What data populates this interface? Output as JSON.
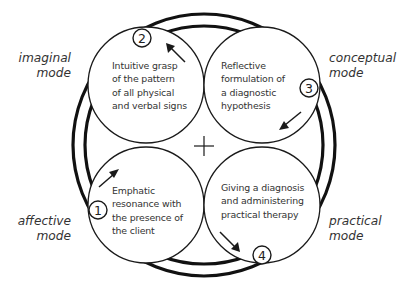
{
  "diagram": {
    "type": "cycle",
    "center_symbol": "+",
    "modes": [
      {
        "id": "imaginal",
        "lines": [
          "imaginal",
          "mode"
        ],
        "position": "top-left"
      },
      {
        "id": "conceptual",
        "lines": [
          "conceptual",
          "mode"
        ],
        "position": "top-right"
      },
      {
        "id": "affective",
        "lines": [
          "affective",
          "mode"
        ],
        "position": "bottom-left"
      },
      {
        "id": "practical",
        "lines": [
          "practical",
          "mode"
        ],
        "position": "bottom-right"
      }
    ],
    "stages": [
      {
        "number": "1",
        "lines": [
          "Emphatic",
          "resonance with",
          "the presence of",
          "the client"
        ],
        "quadrant": "bottom-left"
      },
      {
        "number": "2",
        "lines": [
          "Intuitive grasp",
          "of the pattern",
          "of all physical",
          "and verbal signs"
        ],
        "quadrant": "top-left"
      },
      {
        "number": "3",
        "lines": [
          "Reflective",
          "formulation of",
          "a diagnostic",
          "hypothesis"
        ],
        "quadrant": "top-right"
      },
      {
        "number": "4",
        "lines": [
          "Giving a diagnosis",
          "and administering",
          "practical therapy"
        ],
        "quadrant": "bottom-right"
      }
    ],
    "flow": [
      "1",
      "2",
      "3",
      "4"
    ],
    "colors": {
      "stroke": "#111111",
      "text": "#333333",
      "background": "#ffffff"
    }
  }
}
